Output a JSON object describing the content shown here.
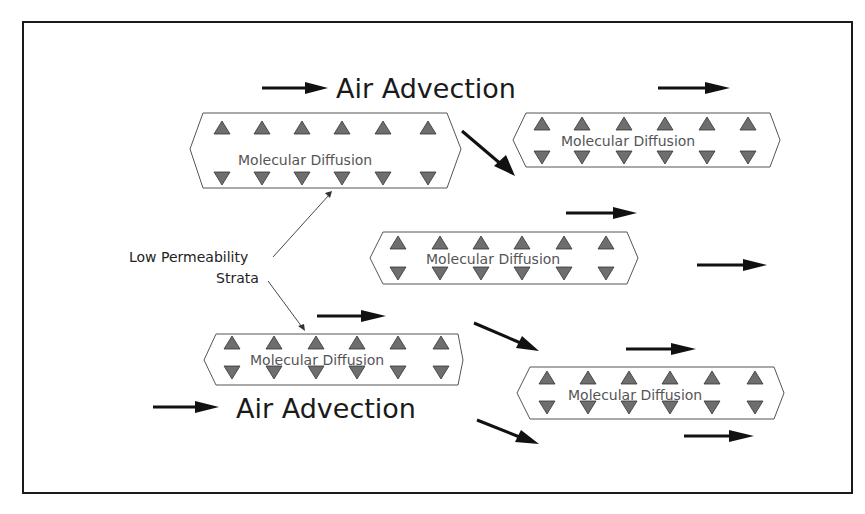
{
  "labels": {
    "advection_top": "Air Advection",
    "advection_bottom": "Air Advection",
    "strata_line1": "Low Permeability",
    "strata_line2": "Strata"
  },
  "boxes": [
    {
      "id": "box-upper-left",
      "label": "Molecular Diffusion"
    },
    {
      "id": "box-upper-right",
      "label": "Molecular Diffusion"
    },
    {
      "id": "box-middle",
      "label": "Molecular Diffusion"
    },
    {
      "id": "box-lower-left",
      "label": "Molecular Diffusion"
    },
    {
      "id": "box-lower-right",
      "label": "Molecular Diffusion"
    }
  ],
  "colors": {
    "triangle_fill": "#6e6e6e",
    "arrow": "#111111",
    "frame": "#1a1a1a"
  }
}
